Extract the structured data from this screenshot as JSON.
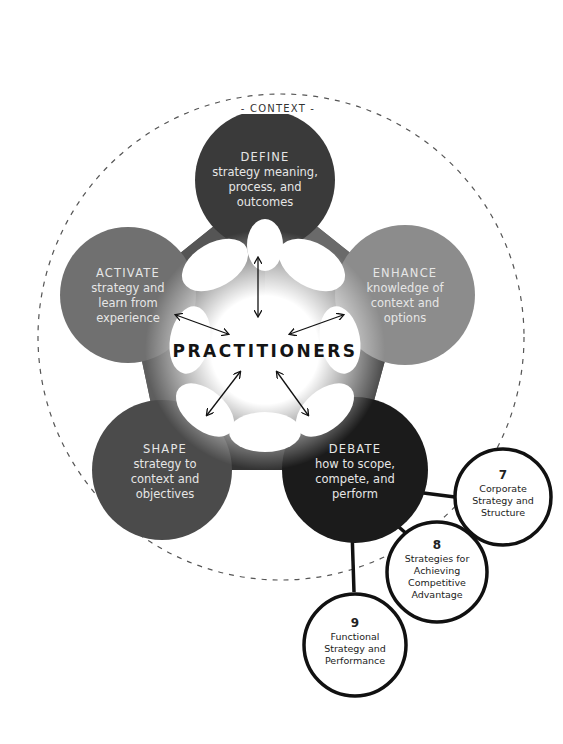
{
  "context": {
    "label": "- CONTEXT -"
  },
  "center": {
    "label": "PRACTITIONERS"
  },
  "nodes": [
    {
      "id": "define",
      "title": "DEFINE",
      "desc": "strategy meaning, process, and outcomes",
      "color": "#3a3a3a"
    },
    {
      "id": "enhance",
      "title": "ENHANCE",
      "desc": "knowledge of context and options",
      "color": "#8c8c8c"
    },
    {
      "id": "debate",
      "title": "DEBATE",
      "desc": "how to scope, compete, and perform",
      "color": "#1b1b1b"
    },
    {
      "id": "shape",
      "title": "SHAPE",
      "desc": "strategy to context and objectives",
      "color": "#4b4b4b"
    },
    {
      "id": "activate",
      "title": "ACTIVATE",
      "desc": "strategy and learn from experience",
      "color": "#707070"
    }
  ],
  "chapters": [
    {
      "number": "7",
      "title": "Corporate Strategy and Structure"
    },
    {
      "number": "8",
      "title": "Strategies for Achieving Competitive Advantage"
    },
    {
      "number": "9",
      "title": "Functional Strategy and Performance"
    }
  ]
}
